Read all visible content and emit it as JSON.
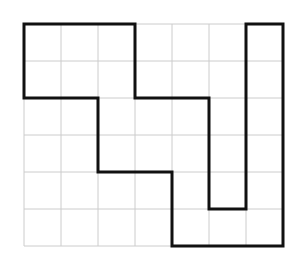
{
  "label": ")",
  "grid": {
    "cols": 7,
    "rows": 6,
    "origin_x": 24,
    "origin_y": 24,
    "cell": 37,
    "grid_color": "#cccccc",
    "outline_color": "#111111"
  },
  "shape": {
    "description": "Rectilinear polygon outline drawn on a 7x6 grid",
    "vertices": [
      [
        0,
        0
      ],
      [
        3,
        0
      ],
      [
        3,
        2
      ],
      [
        5,
        2
      ],
      [
        5,
        5
      ],
      [
        6,
        5
      ],
      [
        6,
        0
      ],
      [
        7,
        0
      ],
      [
        7,
        6
      ],
      [
        4,
        6
      ],
      [
        4,
        4
      ],
      [
        2,
        4
      ],
      [
        2,
        2
      ],
      [
        0,
        2
      ]
    ]
  }
}
